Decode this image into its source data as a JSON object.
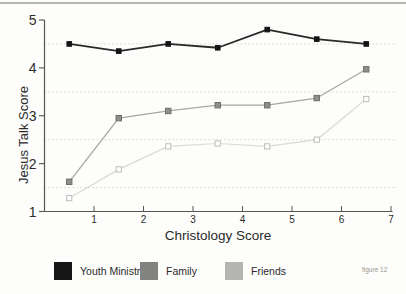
{
  "page": {
    "background": "#fdfdfb",
    "top_border_color": "#b3b3b1"
  },
  "figure_caption": "figure 12",
  "chart_data": {
    "type": "line",
    "title": "",
    "xlabel": "Christology Score",
    "ylabel": "Jesus Talk Score",
    "xlim": [
      0,
      7
    ],
    "ylim": [
      1,
      5
    ],
    "x_ticks": [
      1,
      2,
      3,
      4,
      5,
      6,
      7
    ],
    "y_ticks": [
      1,
      2,
      3,
      4,
      5
    ],
    "gridlines_y": [
      1.5,
      2.5,
      3.5,
      4.5
    ],
    "grid_on": true,
    "legend_position": "bottom",
    "x": [
      0.5,
      1.5,
      2.5,
      3.5,
      4.5,
      5.5,
      6.5
    ],
    "series": [
      {
        "name": "Youth Ministry",
        "values": [
          4.5,
          4.35,
          4.5,
          4.42,
          4.8,
          4.6,
          4.5
        ],
        "line_color": "#2a2a2a",
        "line_width": 1.8,
        "marker": "filled-square",
        "marker_fill": "#141414",
        "marker_stroke": "#141414",
        "marker_size": 4.6,
        "swatch_color": "#161616"
      },
      {
        "name": "Family",
        "values": [
          1.62,
          2.95,
          3.1,
          3.22,
          3.22,
          3.37,
          3.97
        ],
        "line_color": "#a7a7a5",
        "line_width": 1.3,
        "marker": "filled-square",
        "marker_fill": "#8e8e8c",
        "marker_stroke": "#6d6d6b",
        "marker_size": 5.4,
        "swatch_color": "#828280"
      },
      {
        "name": "Friends",
        "values": [
          1.28,
          1.88,
          2.36,
          2.42,
          2.36,
          2.5,
          3.35
        ],
        "line_color": "#dadad7",
        "line_width": 1.2,
        "marker": "hollow-square",
        "marker_fill": "#ffffff",
        "marker_stroke": "#bcbcb9",
        "marker_size": 5.2,
        "swatch_color": "#b4b4b2"
      }
    ],
    "grid_color": "#d4d4ce",
    "axis_color": "#555553",
    "tick_label_color": "#2d2d2d",
    "y_tick_font_size": 14,
    "x_tick_font_size": 10
  }
}
